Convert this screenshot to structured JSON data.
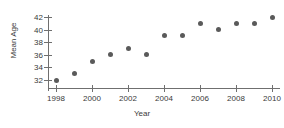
{
  "chart_data": {
    "type": "scatter",
    "title": "",
    "xlabel": "Year",
    "ylabel": "Mean Age",
    "x": [
      1998,
      1999,
      2000,
      2001,
      2002,
      2003,
      2004,
      2005,
      2006,
      2007,
      2008,
      2009,
      2010
    ],
    "values": [
      32,
      33,
      35,
      36,
      37,
      36,
      39,
      39,
      41,
      40,
      41,
      41,
      42
    ],
    "series": [
      {
        "name": "Mean Age",
        "values": [
          32,
          33,
          35,
          36,
          37,
          36,
          39,
          39,
          41,
          40,
          41,
          41,
          42
        ]
      }
    ],
    "xlim": [
      1998,
      2010
    ],
    "ylim": [
      32,
      42
    ],
    "x_ticks": [
      1998,
      2000,
      2002,
      2004,
      2006,
      2008,
      2010
    ],
    "x_tick_labels": [
      "1998",
      "2000",
      "2002",
      "2004",
      "2006",
      "2008",
      "2010"
    ],
    "y_ticks": [
      32,
      34,
      36,
      38,
      40,
      42
    ],
    "y_tick_labels": [
      "32",
      "34",
      "36",
      "38",
      "40",
      "42"
    ],
    "grid": false,
    "legend": "none",
    "marker_color": "#5a5a5a",
    "axis_color": "#6f6f6f",
    "background_color": "#ffffff"
  }
}
